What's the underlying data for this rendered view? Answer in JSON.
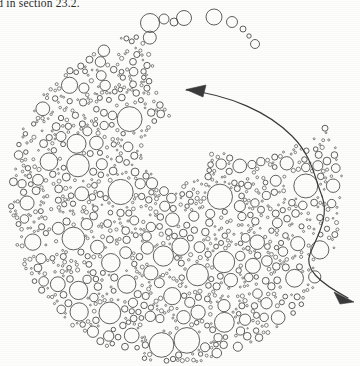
{
  "page": {
    "width": 360,
    "height": 366,
    "background_color": "#fdfdfc",
    "caption_text": "ed in section 23.2."
  },
  "figure": {
    "name": "circle-packing-crescent",
    "stroke_color": "#3a3a3a",
    "fill_color": "none",
    "stroke_width": 0.8,
    "disc": {
      "cx": 176,
      "cy": 196,
      "r": 168
    },
    "void": {
      "cx": 176,
      "cy": 150,
      "r": 46
    },
    "arrows": [
      {
        "name": "arrow-upper-left",
        "direction": "left",
        "tip_x": 184,
        "tip_y": 89,
        "path": "M 186 90 C 230 95, 268 112, 292 136 C 312 156, 314 176, 322 196",
        "head": "M 186 89.5 L 206 85 L 203 97 Z"
      },
      {
        "name": "arrow-lower-right",
        "direction": "down-right",
        "tip_x": 354,
        "tip_y": 303,
        "path": "M 322 196 C 330 218, 316 238, 310 254 C 304 268, 318 282, 348 298",
        "head": "M 354 302 L 334 292 L 340 304 Z"
      }
    ],
    "circle_count": 980,
    "size_range": [
      0.9,
      13.5
    ]
  },
  "chart_data": {
    "type": "scatter",
    "title": "",
    "xlabel": "",
    "ylabel": "",
    "note": "Circle-packing diagram: each datum is a circle (cx, cy, r) in page pixel coordinates.",
    "xlim": [
      0,
      360
    ],
    "ylim": [
      0,
      366
    ],
    "grid": false,
    "legend": null,
    "seed": 20231102,
    "packing": {
      "disc_cx": 176,
      "disc_cy": 196,
      "disc_r": 168,
      "void_cx": 176,
      "void_cy": 150,
      "void_r": 46,
      "crescent_bite_cx": 250,
      "crescent_bite_cy": 60,
      "crescent_bite_r": 96,
      "r_min": 0.9,
      "r_max": 13.5,
      "attempts": 26000,
      "gap": 0.55
    },
    "stray_chain": [
      {
        "cx": 150,
        "cy": 23,
        "r": 9.5
      },
      {
        "cx": 164,
        "cy": 19,
        "r": 5.0
      },
      {
        "cx": 174,
        "cy": 22,
        "r": 4.0
      },
      {
        "cx": 184,
        "cy": 18,
        "r": 7.5
      },
      {
        "cx": 214,
        "cy": 17,
        "r": 8.0
      },
      {
        "cx": 232,
        "cy": 22,
        "r": 5.5
      },
      {
        "cx": 243,
        "cy": 29,
        "r": 3.0
      },
      {
        "cx": 249,
        "cy": 36,
        "r": 2.2
      },
      {
        "cx": 255,
        "cy": 44,
        "r": 4.5
      }
    ]
  }
}
